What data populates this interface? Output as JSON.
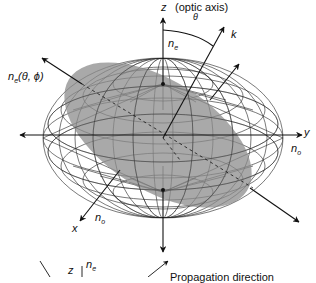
{
  "figure": {
    "type": "index-ellipsoid",
    "labels": {
      "z_axis": "z",
      "optic_axis": "(optic axis)",
      "theta": "θ",
      "k": "k",
      "n_e_top": "n",
      "n_e_top_sub": "e",
      "n_e_theta_phi": "n",
      "n_e_theta_phi_sub": "e",
      "n_e_theta_phi_args": "(θ, ϕ)",
      "y_axis": "y",
      "n_o_right": "n",
      "n_o_right_sub": "o",
      "x_axis": "x",
      "n_o_left": "n",
      "n_o_left_sub": "o"
    },
    "colors": {
      "mesh": "#222222",
      "ellipse_fill": "#8c8c8c",
      "arrow": "#111111",
      "background": "#ffffff"
    }
  },
  "inset": {
    "z_label": "z",
    "n_e": "n",
    "n_e_sub": "e",
    "caption": "Propagation direction"
  }
}
